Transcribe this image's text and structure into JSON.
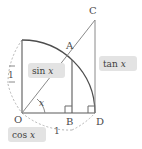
{
  "figure": {
    "type": "geometric-diagram"
  },
  "vertices": [
    {
      "id": "O",
      "label": "O",
      "x": 22,
      "y": 113,
      "label_x": 15,
      "label_y": 122
    },
    {
      "id": "A",
      "label": "A",
      "x": 72,
      "y": 60,
      "label_x": 68,
      "label_y": 47
    },
    {
      "id": "B",
      "label": "B",
      "x": 72,
      "y": 113,
      "label_x": 68,
      "label_y": 124
    },
    {
      "id": "C",
      "label": "C",
      "x": 95,
      "y": 20,
      "label_x": 91,
      "label_y": 12
    },
    {
      "id": "D",
      "label": "D",
      "x": 95,
      "y": 113,
      "label_x": 97,
      "label_y": 124
    }
  ],
  "labels": {
    "radius_vertical": "1",
    "radius_arc": "1",
    "angle": "x",
    "sin_prefix": "sin",
    "sin_var": "x",
    "cos_prefix": "cos",
    "cos_var": "x",
    "tan_prefix": "tan",
    "tan_var": "x"
  },
  "chips": [
    {
      "name": "sin-label-chip",
      "text_prefix": "sin",
      "text_var": "x",
      "x": 28,
      "y": 63,
      "w": 37,
      "h": 15
    },
    {
      "name": "tan-label-chip",
      "text_prefix": "tan",
      "text_var": "x",
      "x": 99,
      "y": 56,
      "w": 38,
      "h": 15
    },
    {
      "name": "cos-label-chip",
      "text_prefix": "cos",
      "text_var": "x",
      "x": 8,
      "y": 127,
      "w": 38,
      "h": 15
    }
  ],
  "geometry": {
    "origin_x": 22,
    "origin_y": 113,
    "radius": 73,
    "angle_degrees": 47,
    "colors": {
      "solid_line": "#5a5a5a",
      "arc_line": "#4d4d4d",
      "dashed_line": "#b4b4b4",
      "chip_fill": "#e3e3e3",
      "text": "#4a4a4a",
      "background": "#ffffff"
    }
  }
}
